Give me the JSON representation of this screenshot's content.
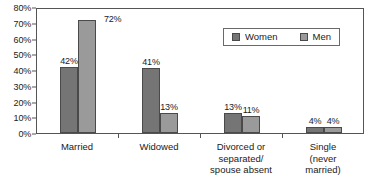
{
  "chart_data": {
    "type": "bar",
    "title": "",
    "subtitle": "",
    "xlabel": "",
    "ylabel": "",
    "ylim": [
      0,
      80
    ],
    "grid": false,
    "legend_position": "top-right-inside",
    "y_ticks": [
      "0%",
      "10%",
      "20%",
      "30%",
      "40%",
      "50%",
      "60%",
      "70%",
      "80%"
    ],
    "y_tick_values": [
      0,
      10,
      20,
      30,
      40,
      50,
      60,
      70,
      80
    ],
    "categories": [
      "Married",
      "Widowed",
      "Divorced or\nseparated/\nspouse absent",
      "Single\n(never\nmarried)"
    ],
    "series": [
      {
        "name": "Women",
        "color": "#757575",
        "values": [
          42,
          41,
          13,
          4
        ],
        "labels": [
          "42%",
          "41%",
          "13%",
          "4%"
        ]
      },
      {
        "name": "Men",
        "color": "#9a9a9a",
        "values": [
          72,
          13,
          11,
          4
        ],
        "labels": [
          "72%",
          "13%",
          "11%",
          "4%"
        ]
      }
    ]
  },
  "legend": {
    "entries": [
      {
        "label": "Women",
        "color": "#757575"
      },
      {
        "label": "Men",
        "color": "#9a9a9a"
      }
    ]
  },
  "colors": {
    "women_bar": "#757575",
    "men_bar": "#9a9a9a",
    "axis": "#555555",
    "bar_outline": "#4a4a4a",
    "text": "#1a1a1a",
    "background": "#ffffff"
  }
}
